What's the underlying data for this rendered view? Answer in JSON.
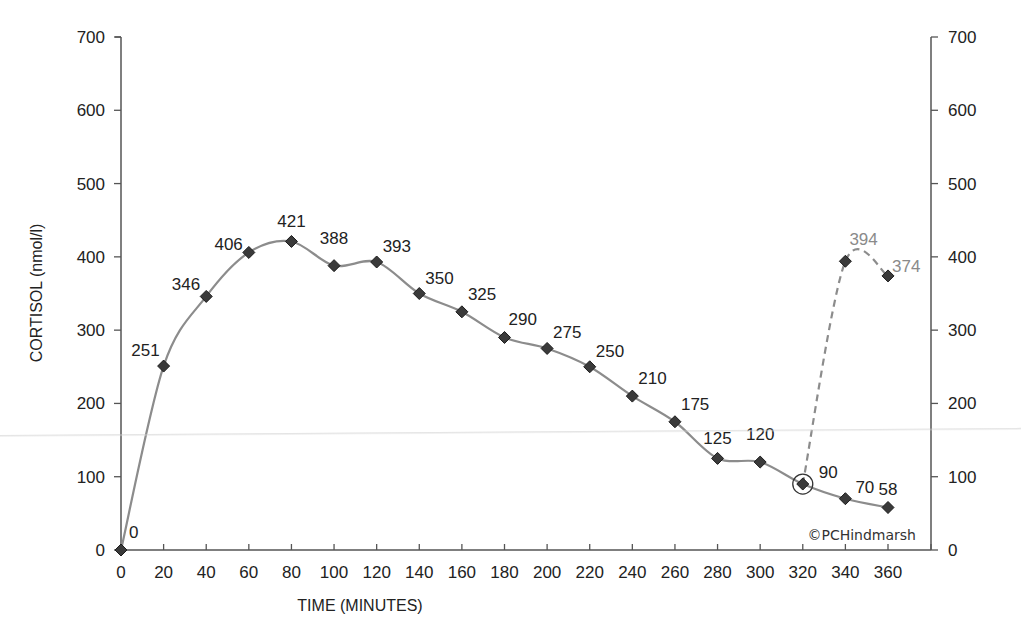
{
  "chart_data": {
    "type": "line",
    "title": "",
    "xlabel": "TIME (MINUTES)",
    "ylabel": "CORTISOL (nmol/l)",
    "xlim": [
      0,
      360
    ],
    "ylim": [
      0,
      700
    ],
    "x_ticks": [
      0,
      20,
      40,
      60,
      80,
      100,
      120,
      140,
      160,
      180,
      200,
      220,
      240,
      260,
      280,
      300,
      320,
      340,
      360
    ],
    "y_ticks": [
      0,
      100,
      200,
      300,
      400,
      500,
      600,
      700
    ],
    "y2_ticks": [
      0,
      100,
      200,
      300,
      400,
      500,
      600,
      700
    ],
    "grid": false,
    "legend": null,
    "series": [
      {
        "name": "Cortisol profile",
        "style": "solid",
        "color": "#8c8c8c",
        "x": [
          0,
          20,
          40,
          60,
          80,
          100,
          120,
          140,
          160,
          180,
          200,
          220,
          240,
          260,
          280,
          300,
          320,
          340,
          360
        ],
        "values": [
          0,
          251,
          346,
          406,
          421,
          388,
          393,
          350,
          325,
          290,
          275,
          250,
          210,
          175,
          125,
          120,
          90,
          70,
          58
        ],
        "labels": [
          "0",
          "251",
          "346",
          "406",
          "421",
          "388",
          "393",
          "350",
          "325",
          "290",
          "275",
          "250",
          "210",
          "175",
          "125",
          "120",
          "90",
          "70",
          "58"
        ]
      },
      {
        "name": "Post-dose profile",
        "style": "dashed",
        "color": "#8c8c8c",
        "x": [
          320,
          340,
          360
        ],
        "values": [
          90,
          394,
          374
        ],
        "labels": [
          "",
          "394",
          "374"
        ]
      }
    ],
    "annotations": [
      {
        "type": "circle",
        "x": 320,
        "y": 90,
        "note": "highlighted point"
      },
      {
        "type": "text",
        "text": "©PCHindmarsh",
        "position": "bottom-right"
      }
    ]
  },
  "labels": {
    "xlabel": "TIME (MINUTES)",
    "ylabel": "CORTISOL (nmol/l)",
    "copyright": "©PCHindmarsh"
  }
}
